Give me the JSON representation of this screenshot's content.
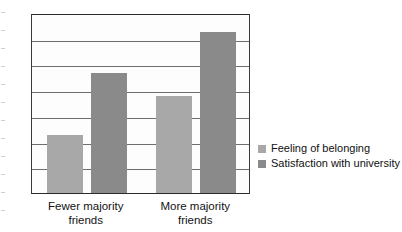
{
  "chart_data": {
    "type": "bar",
    "title": "",
    "subtitle": "",
    "xlabel": "",
    "ylabel": "",
    "ylim": [
      0,
      7
    ],
    "ytick_step": 1,
    "yticks": [
      "7",
      "6",
      "5",
      "4",
      "3",
      "2",
      "1",
      "0"
    ],
    "grid": true,
    "grid_axis": "y",
    "legend_position": "right",
    "categories": [
      "Fewer majority\nfriends",
      "More majority\nfriends"
    ],
    "series": [
      {
        "name": "Feeling of belonging",
        "color": "#a8a8a8",
        "values": [
          2.25,
          3.78
        ]
      },
      {
        "name": "Satisfaction with university",
        "color": "#8a8a8a",
        "values": [
          4.65,
          6.28
        ]
      }
    ]
  },
  "legend": {
    "items": [
      {
        "label": "Feeling of belonging",
        "swatch": "legend-swatch-light"
      },
      {
        "label": "Satisfaction with university",
        "swatch": "legend-swatch-dark"
      }
    ]
  },
  "axis": {
    "y_tick_labels": [
      "7",
      "6",
      "5",
      "4",
      "3",
      "2",
      "1",
      "0"
    ],
    "x_category_labels": [
      "Fewer majority\nfriends",
      "More majority\nfriends"
    ]
  }
}
